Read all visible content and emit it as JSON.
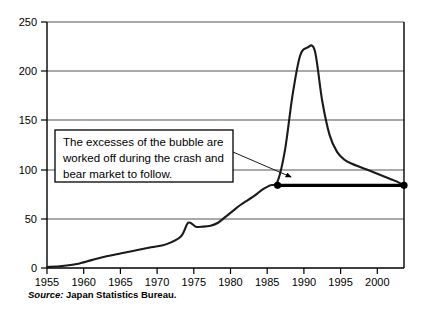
{
  "chart_data": {
    "type": "line",
    "title": "",
    "subtitle": "",
    "xlabel": "",
    "ylabel": "",
    "xlim": [
      1955,
      2003
    ],
    "ylim": [
      0,
      250
    ],
    "grid": true,
    "grid_axis": "y",
    "legend": "none",
    "x_ticks": [
      "1955",
      "1960",
      "1965",
      "1970",
      "1975",
      "1980",
      "1985",
      "1990",
      "1995",
      "2000"
    ],
    "y_ticks": [
      "0",
      "50",
      "100",
      "150",
      "200",
      "250"
    ],
    "series": [
      {
        "name": "Japan land price index",
        "style": "line",
        "x": [
          1955,
          1957,
          1959,
          1961,
          1963,
          1965,
          1967,
          1969,
          1971,
          1973,
          1974,
          1975,
          1976,
          1977,
          1978,
          1979,
          1980,
          1981,
          1982,
          1983,
          1984,
          1985,
          1986,
          1987,
          1988,
          1989,
          1990,
          1991,
          1992,
          1993,
          1994,
          1995,
          1996,
          1997,
          1998,
          1999,
          2000,
          2001,
          2002,
          2003
        ],
        "values": [
          1,
          2,
          4,
          8,
          12,
          15,
          18,
          21,
          24,
          32,
          46,
          42,
          42,
          43,
          46,
          52,
          58,
          64,
          69,
          74,
          80,
          84,
          88,
          120,
          175,
          215,
          224,
          221,
          170,
          135,
          118,
          110,
          106,
          103,
          100,
          97,
          94,
          91,
          88,
          84
        ]
      },
      {
        "name": "Bubble excess reference line",
        "style": "thick-line-with-endpoint-markers",
        "x": [
          1986,
          2003
        ],
        "values": [
          84,
          84
        ]
      }
    ],
    "annotations": [
      {
        "name": "bubble-excess-callout",
        "text_lines": [
          "The excesses of the bubble are",
          "worked off during the crash and",
          "bear market to follow."
        ],
        "arrow_from": {
          "x": 1986.5,
          "y": 128
        },
        "arrow_to": {
          "x": 1993,
          "y": 92
        }
      }
    ],
    "peak": {
      "x": 1990,
      "y": 224
    },
    "source": {
      "label": "Source:",
      "text": "Japan Statistics Bureau."
    }
  }
}
